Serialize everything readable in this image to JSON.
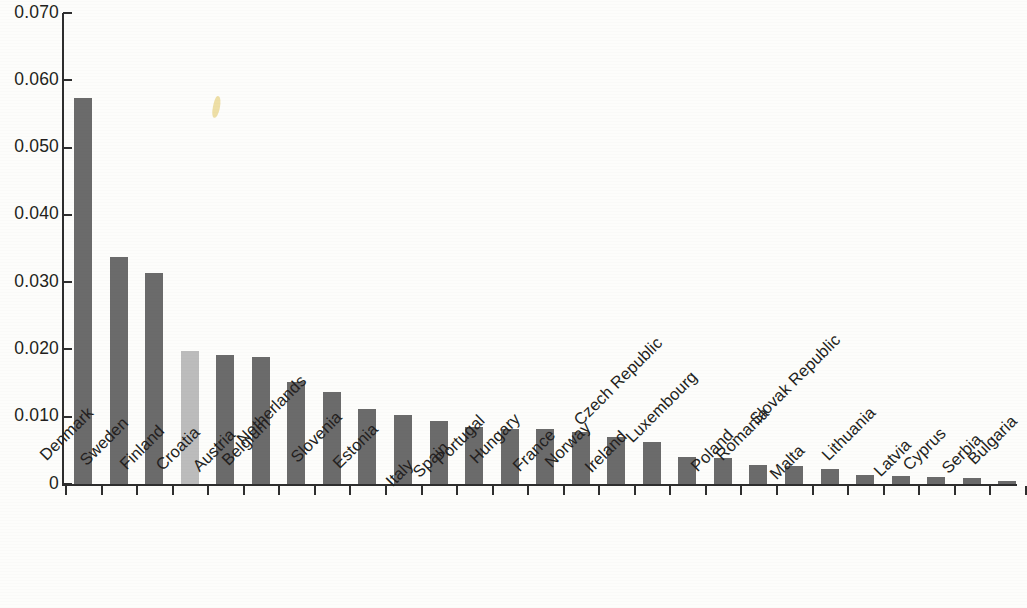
{
  "chart_data": {
    "type": "bar",
    "title": "",
    "subtitle": "",
    "xlabel": "",
    "ylabel": "",
    "ylim": [
      0,
      0.07
    ],
    "grid": false,
    "legend": null,
    "y_ticks": [
      0,
      0.01,
      0.02,
      0.03,
      0.04,
      0.05,
      0.06,
      0.07
    ],
    "y_tick_labels": [
      "0",
      "0.010",
      "0.020",
      "0.030",
      "0.040",
      "0.050",
      "0.060",
      "0.070"
    ],
    "highlight_category": "Croatia",
    "colors": {
      "bar": "#6b6b6b",
      "bar_highlight": "#bcbcbc",
      "axis": "#2e2e2e",
      "text": "#231f20",
      "background": "#fdfdfb"
    },
    "categories": [
      "Denmark",
      "Sweden",
      "Finland",
      "Croatia",
      "Austria",
      "Belgium",
      "Netherlands",
      "Slovenia",
      "Estonia",
      "Italy",
      "Spain",
      "Portugal",
      "Hungary",
      "France",
      "Norway",
      "Ireland",
      "Czech Republic",
      "Luxembourg",
      "Poland",
      "Romania",
      "Malta",
      "Slovak Republic",
      "Lithuania",
      "Latvia",
      "Cyprus",
      "Serbia",
      "Bulgaria"
    ],
    "values": [
      0.0573,
      0.0338,
      0.0313,
      0.0198,
      0.0192,
      0.0189,
      0.0151,
      0.0137,
      0.0112,
      0.0102,
      0.0094,
      0.0085,
      0.0081,
      0.0081,
      0.0078,
      0.007,
      0.0063,
      0.004,
      0.0038,
      0.0028,
      0.0027,
      0.0023,
      0.0014,
      0.0012,
      0.0011,
      0.0009,
      0.0005
    ]
  }
}
